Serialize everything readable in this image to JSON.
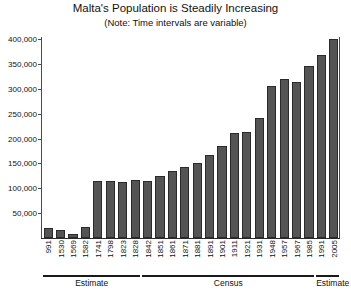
{
  "chart_data": {
    "type": "bar",
    "title": "Malta's Population is Steadily Increasing",
    "subtitle": "(Note: Time intervals are variable)",
    "xlabel": "",
    "ylabel": "",
    "ylim": [
      0,
      400000
    ],
    "ytick_values": [
      50000,
      100000,
      150000,
      200000,
      250000,
      300000,
      350000,
      400000
    ],
    "ytick_labels": [
      "50,000",
      "100,000",
      "150,000",
      "200,000",
      "250,000",
      "300,000",
      "350,000",
      "400,000"
    ],
    "grid": false,
    "legend": "none",
    "bar_color": "#545454",
    "bar_edge_color": "#2a2a2a",
    "categories": [
      "991",
      "1530",
      "1569",
      "1582",
      "1741",
      "1798",
      "1823",
      "1828",
      "1842",
      "1851",
      "1861",
      "1871",
      "1881",
      "1891",
      "1901",
      "1911",
      "1921",
      "1931",
      "1948",
      "1957",
      "1967",
      "1985",
      "1991",
      "2005"
    ],
    "values": [
      20000,
      17000,
      9000,
      23000,
      115000,
      114000,
      112000,
      117000,
      114000,
      124000,
      134000,
      142000,
      150000,
      166000,
      185000,
      212000,
      213000,
      242000,
      306000,
      319000,
      314000,
      345000,
      368000,
      400000
    ],
    "groups": [
      {
        "label": "Estimate",
        "start_index": 0,
        "end_index": 7
      },
      {
        "label": "Census",
        "start_index": 8,
        "end_index": 21
      },
      {
        "label": "Estimate",
        "start_index": 22,
        "end_index": 23
      }
    ]
  }
}
